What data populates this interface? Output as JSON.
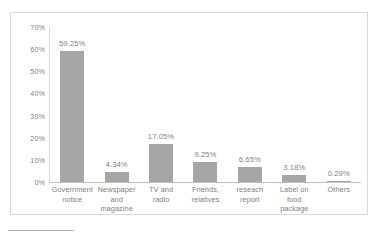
{
  "chart_data": {
    "type": "bar",
    "title": "",
    "xlabel": "",
    "ylabel": "",
    "categories": [
      "Government notice",
      "Newspaper and magazine",
      "TV and radio",
      "Friends, relatives",
      "reseach report",
      "Label on food package",
      "Others"
    ],
    "values": [
      59.25,
      4.34,
      17.05,
      9.25,
      6.65,
      3.18,
      0.29
    ],
    "value_labels": [
      "59.25%",
      "4.34%",
      "17.05%",
      "9.25%",
      "6.65%",
      "3.18%",
      "0.29%"
    ],
    "ylim": [
      0,
      70
    ],
    "ytick_values": [
      0,
      10,
      20,
      30,
      40,
      50,
      60,
      70
    ],
    "ytick_labels": [
      "0%",
      "10%",
      "20%",
      "30%",
      "40%",
      "50%",
      "60%",
      "70%"
    ],
    "grid": false,
    "legend": false,
    "bar_color": "#a6a6a6",
    "axis_color": "#bfbfbf",
    "text_color": "#7f7f7f",
    "border_color": "#d9d9d9"
  }
}
